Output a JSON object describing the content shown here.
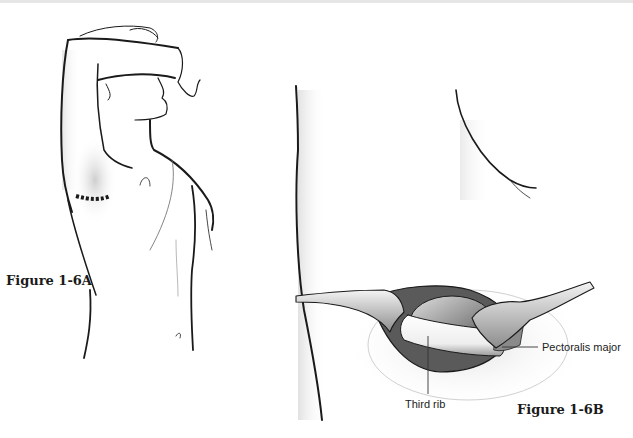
{
  "figures": {
    "a": {
      "label": "Figure 1-6A"
    },
    "b": {
      "label": "Figure 1-6B"
    }
  },
  "callouts": {
    "pectoralis": "Pectoralis major",
    "third_rib": "Third rib"
  },
  "colors": {
    "ink": "#1a1a1a",
    "shade": "#bdbdbd",
    "background": "#ffffff"
  }
}
